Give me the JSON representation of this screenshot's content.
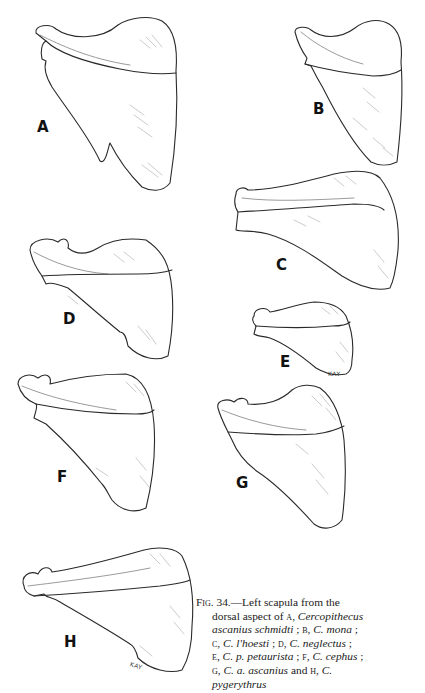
{
  "figure": {
    "number_prefix": "Fig.",
    "number": "34.",
    "panels": [
      {
        "letter": "A",
        "species": "Cercopithecus ascanius schmidti"
      },
      {
        "letter": "B",
        "species": "C. mona"
      },
      {
        "letter": "C",
        "species": "C. l'hoesti"
      },
      {
        "letter": "D",
        "species": "C. neglectus"
      },
      {
        "letter": "E",
        "species": "C. p. petaurista"
      },
      {
        "letter": "F",
        "species": "C. cephus"
      },
      {
        "letter": "G",
        "species": "C. a. ascanius"
      },
      {
        "letter": "H",
        "species": "C. pygerythrus"
      }
    ],
    "signatures": {
      "E": "KAY",
      "H": "KAY"
    },
    "caption": {
      "l1_a": "Fig.",
      "l1_b": " 34.—Left scapula from the",
      "l2_a": "dorsal aspect of ",
      "l2_b": "a",
      "l2_c": ", ",
      "l2_d": "Cercopithecus",
      "l3_a": "ascanius schmidti",
      "l3_b": " ; ",
      "l3_c": "b",
      "l3_d": ", ",
      "l3_e": "C. mona",
      "l3_f": " ;",
      "l4_a": "c",
      "l4_b": ", ",
      "l4_c": "C. l'hoesti",
      "l4_d": " ; ",
      "l4_e": "d",
      "l4_f": ", ",
      "l4_g": "C. neglectus",
      "l4_h": " ;",
      "l5_a": "e",
      "l5_b": ", ",
      "l5_c": "C. p. petaurista",
      "l5_d": " ; ",
      "l5_e": "f",
      "l5_f": ", ",
      "l5_g": "C. cephus",
      "l5_h": " ;",
      "l6_a": "g",
      "l6_b": ", ",
      "l6_c": "C. a. ascanius",
      "l6_d": " and ",
      "l6_e": "h",
      "l6_f": ", ",
      "l6_g": "C.",
      "l7_a": "pygerythrus"
    }
  }
}
